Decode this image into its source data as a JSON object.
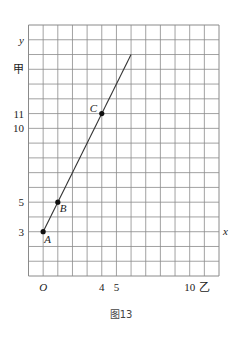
{
  "figure": {
    "caption": "图13",
    "grid": {
      "x_range": [
        -1,
        12
      ],
      "y_range": [
        0,
        17
      ],
      "step": 1
    },
    "axis_labels": {
      "x": "x",
      "y": "y",
      "origin": "O"
    },
    "y_ticks": [
      {
        "value": 3,
        "label": "3"
      },
      {
        "value": 5,
        "label": "5"
      },
      {
        "value": 10,
        "label": "10"
      },
      {
        "value": 11,
        "label": "11"
      },
      {
        "value": 14,
        "label": "甲"
      }
    ],
    "x_ticks": [
      {
        "value": 4,
        "label": "4"
      },
      {
        "value": 5,
        "label": "5"
      },
      {
        "value": 10,
        "label": "10"
      },
      {
        "value": 11,
        "label": "乙"
      }
    ],
    "line": {
      "from": [
        0,
        3
      ],
      "to": [
        6,
        15
      ]
    },
    "points": [
      {
        "name": "A",
        "x": 0,
        "y": 3
      },
      {
        "name": "B",
        "x": 1,
        "y": 5
      },
      {
        "name": "C",
        "x": 4,
        "y": 11
      }
    ],
    "colors": {
      "grid": "#8a8a8a",
      "line": "#333333",
      "point": "#111111"
    }
  },
  "chart_data": {
    "type": "line",
    "title": "图13",
    "xlabel": "x",
    "ylabel": "y",
    "xlim": [
      -1,
      12
    ],
    "ylim": [
      0,
      17
    ],
    "grid": true,
    "series": [
      {
        "name": "y = 2x + 3",
        "x": [
          0,
          6
        ],
        "y": [
          3,
          15
        ]
      }
    ],
    "points": [
      {
        "label": "A",
        "x": 0,
        "y": 3
      },
      {
        "label": "B",
        "x": 1,
        "y": 5
      },
      {
        "label": "C",
        "x": 4,
        "y": 11
      }
    ],
    "x_tick_labels": [
      "O",
      "4",
      "5",
      "10",
      "乙"
    ],
    "y_tick_labels": [
      "3",
      "5",
      "10",
      "11",
      "甲"
    ]
  }
}
